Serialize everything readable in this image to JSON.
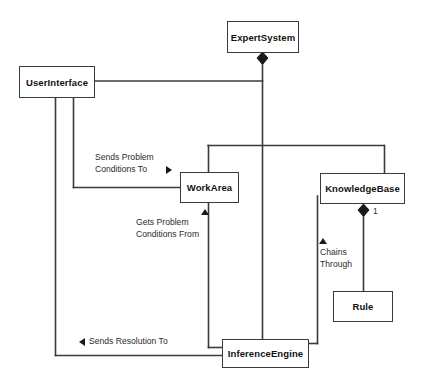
{
  "diagram": {
    "type": "uml-class-diagram",
    "line_color": "#3a3a3a",
    "text_color": "#111111",
    "background": "#ffffff",
    "classes": [
      {
        "id": "expert-system",
        "name": "ExpertSystem",
        "x": 227,
        "y": 21,
        "w": 72,
        "h": 32
      },
      {
        "id": "user-interface",
        "name": "UserInterface",
        "x": 19,
        "y": 66,
        "w": 76,
        "h": 32
      },
      {
        "id": "work-area",
        "name": "WorkArea",
        "x": 180,
        "y": 172,
        "w": 59,
        "h": 31
      },
      {
        "id": "knowledge-base",
        "name": "KnowledgeBase",
        "x": 320,
        "y": 173,
        "w": 85,
        "h": 31
      },
      {
        "id": "rule",
        "name": "Rule",
        "x": 333,
        "y": 291,
        "w": 60,
        "h": 31
      },
      {
        "id": "inference-engine",
        "name": "InferenceEngine",
        "x": 222,
        "y": 339,
        "w": 87,
        "h": 29
      }
    ],
    "relationship_labels": [
      {
        "id": "sends-problem-conditions-to",
        "line1": "Sends Problem",
        "line2": "Conditions To",
        "arrow": "right"
      },
      {
        "id": "gets-problem-conditions-from",
        "line1": "Gets Problem",
        "line2": "Conditions From",
        "arrow": "up"
      },
      {
        "id": "chains-through",
        "line1": "Chains",
        "line2": "Through",
        "arrow": "up"
      },
      {
        "id": "sends-resolution-to",
        "line1": "Sends Resolution To",
        "line2": "",
        "arrow": "left"
      }
    ],
    "multiplicities": [
      {
        "id": "knowledgebase-rule-multiplicity",
        "value": "1"
      }
    ],
    "compositions": [
      {
        "id": "expertsystem-composition-diamond",
        "owner": "ExpertSystem"
      },
      {
        "id": "knowledgebase-rule-diamond",
        "owner": "KnowledgeBase"
      }
    ]
  }
}
